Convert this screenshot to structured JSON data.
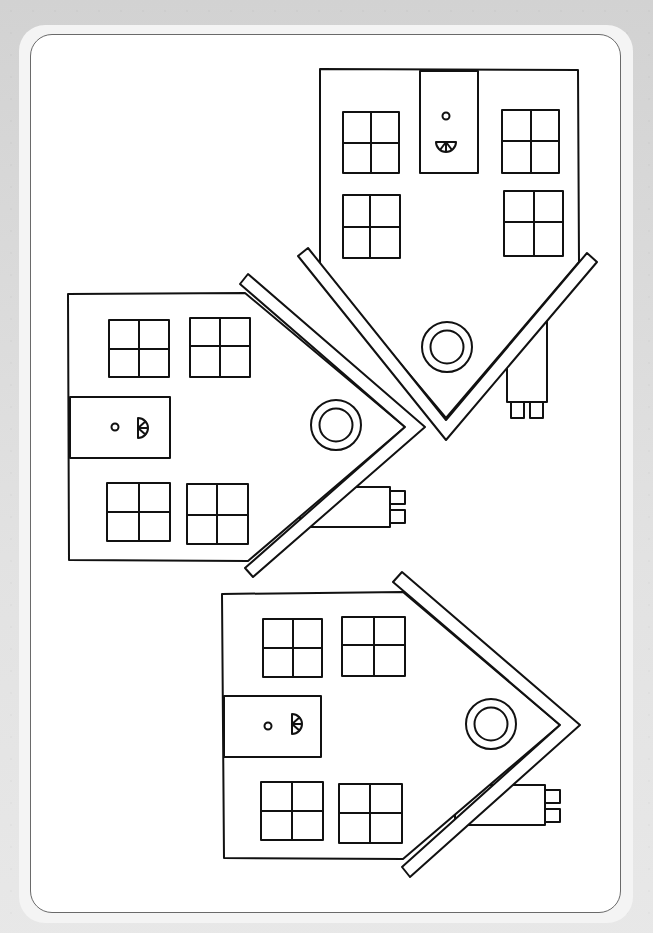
{
  "page": {
    "type": "coloring-page",
    "line_color": "#111111",
    "paper_color": "#ffffff",
    "background_color": "#d9d9d9"
  },
  "houses": [
    {
      "name": "upside-down-house",
      "orientation": "roof-down",
      "windows": 4,
      "has_door": true,
      "has_round_window": true,
      "has_chimney": true
    },
    {
      "name": "sideways-house-middle",
      "orientation": "roof-right",
      "windows": 4,
      "has_door": true,
      "has_round_window": true,
      "has_chimney": true
    },
    {
      "name": "sideways-house-bottom",
      "orientation": "roof-right",
      "windows": 4,
      "has_door": true,
      "has_round_window": true,
      "has_chimney": true
    }
  ]
}
